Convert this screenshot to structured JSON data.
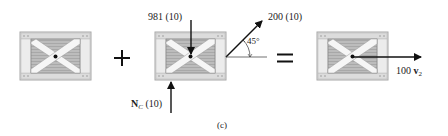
{
  "figure": {
    "caption": "(c)",
    "operators": {
      "plus": "+",
      "equals": "="
    }
  },
  "term1": {
    "description": "momentum diagram of crate (initial)",
    "label": ""
  },
  "term2": {
    "description": "impulse diagram",
    "weight_impulse": "981 (10)",
    "normal_impulse_symbol": "N",
    "normal_impulse_subscript": "C",
    "normal_impulse_value": "(10)",
    "applied_impulse": "200 (10)",
    "angle": "45°"
  },
  "term3": {
    "description": "momentum diagram of crate (final)",
    "momentum_coefficient": "100 ",
    "momentum_symbol": "v",
    "momentum_subscript": "2"
  },
  "colors": {
    "ink": "#111111",
    "crate_frame": "#d8d8d8",
    "crate_frame_edge": "#a8a8a8",
    "crate_panel": "#b8b8b8",
    "crate_brace": "#f4f4f4"
  }
}
